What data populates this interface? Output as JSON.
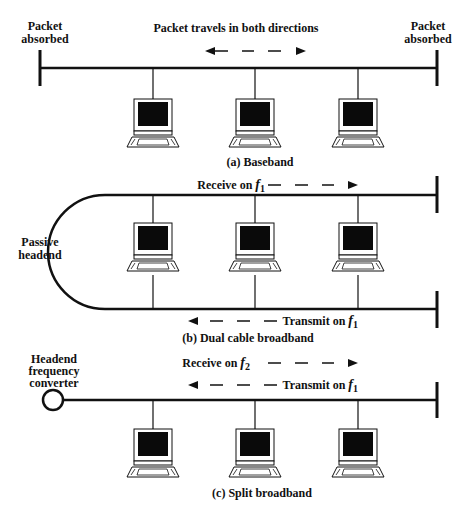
{
  "figure": {
    "panels": [
      {
        "id": "baseband",
        "caption": "(a) Baseband",
        "top_label": "Packet travels in both directions",
        "left_end_label": [
          "Packet",
          "absorbed"
        ],
        "right_end_label": [
          "Packet",
          "absorbed"
        ],
        "stations": 3
      },
      {
        "id": "dual-cable",
        "caption": "(b) Dual cable broadband",
        "headend_label": [
          "Passive",
          "headend"
        ],
        "receive_label": "Receive on ",
        "receive_freq": "f",
        "receive_sub": "1",
        "transmit_label": "Transmit on ",
        "transmit_freq": "f",
        "transmit_sub": "1",
        "stations": 3
      },
      {
        "id": "split",
        "caption": "(c) Split broadband",
        "headend_label": [
          "Headend",
          "frequency",
          "converter"
        ],
        "receive_label": "Receive on ",
        "receive_freq": "f",
        "receive_sub": "2",
        "transmit_label": "Transmit on ",
        "transmit_freq": "f",
        "transmit_sub": "1",
        "stations": 3
      }
    ],
    "colors": {
      "line": "#111111",
      "screen": "#0a0a0a",
      "background": "#ffffff"
    }
  }
}
